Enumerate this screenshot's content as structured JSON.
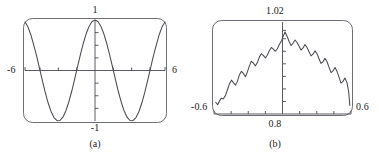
{
  "figure": {
    "caption_a": "(a)",
    "caption_b": "(b)",
    "stroke_color": "#4a4a52",
    "frame_color": "#6e6e76",
    "text_color": "#1b1b1b"
  },
  "chart_data": [
    {
      "type": "line",
      "id": "panel-a",
      "title": "",
      "caption": "(a)",
      "xlabel": "",
      "ylabel": "",
      "xlim": [
        -6,
        6
      ],
      "ylim": [
        -1,
        1
      ],
      "grid": false,
      "legend": null,
      "axis_style": "calculator-screen",
      "tick_labels": {
        "left": "-6",
        "right": "6",
        "top": "1",
        "bottom": "-1"
      },
      "x_ticks": [
        -4.71,
        -3.14,
        -1.57,
        1.57,
        3.14,
        4.71
      ],
      "y_ticks": [
        -0.75,
        -0.5,
        -0.25,
        0.25,
        0.5,
        0.75
      ],
      "series": [
        {
          "name": "cos(x)",
          "x": [
            -6,
            -5.75,
            -5.5,
            -5.25,
            -5,
            -4.75,
            -4.5,
            -4.25,
            -4,
            -3.75,
            -3.5,
            -3.25,
            -3,
            -2.75,
            -2.5,
            -2.25,
            -2,
            -1.75,
            -1.5,
            -1.25,
            -1,
            -0.75,
            -0.5,
            -0.25,
            0,
            0.25,
            0.5,
            0.75,
            1,
            1.25,
            1.5,
            1.75,
            2,
            2.25,
            2.5,
            2.75,
            3,
            3.25,
            3.5,
            3.75,
            4,
            4.25,
            4.5,
            4.75,
            5,
            5.25,
            5.5,
            5.75,
            6
          ],
          "y": [
            0.96,
            0.865,
            0.709,
            0.502,
            0.284,
            0.035,
            -0.211,
            -0.447,
            -0.654,
            -0.821,
            -0.936,
            -0.994,
            -0.99,
            -0.924,
            -0.801,
            -0.628,
            -0.416,
            -0.178,
            0.071,
            0.315,
            0.54,
            0.732,
            0.878,
            0.969,
            1,
            0.969,
            0.878,
            0.732,
            0.54,
            0.315,
            0.071,
            -0.178,
            -0.416,
            -0.628,
            -0.801,
            -0.924,
            -0.99,
            -0.994,
            -0.936,
            -0.821,
            -0.654,
            -0.447,
            -0.211,
            0.035,
            0.284,
            0.502,
            0.709,
            0.865,
            0.96
          ]
        }
      ]
    },
    {
      "type": "line",
      "id": "panel-b",
      "title": "",
      "caption": "(b)",
      "xlabel": "",
      "ylabel": "",
      "xlim": [
        -0.6,
        0.6
      ],
      "ylim": [
        0.8,
        1.02
      ],
      "grid": false,
      "legend": null,
      "axis_style": "calculator-screen",
      "tick_labels": {
        "left": "-0.6",
        "right": "0.6",
        "top": "1.02",
        "bottom": "0.8"
      },
      "x_ticks": [
        -0.45,
        -0.3,
        -0.15,
        0.15,
        0.3,
        0.45
      ],
      "y_ticks": [
        0.83,
        0.86,
        0.89,
        0.92,
        0.95,
        0.98,
        1.0
      ],
      "series": [
        {
          "name": "sampled oscillation",
          "x": [
            -0.585,
            -0.568,
            -0.552,
            -0.536,
            -0.52,
            -0.5,
            -0.482,
            -0.465,
            -0.447,
            -0.43,
            -0.412,
            -0.395,
            -0.378,
            -0.36,
            -0.343,
            -0.325,
            -0.308,
            -0.29,
            -0.273,
            -0.255,
            -0.238,
            -0.22,
            -0.203,
            -0.185,
            -0.168,
            -0.15,
            -0.133,
            -0.115,
            -0.098,
            -0.08,
            -0.063,
            -0.045,
            -0.028,
            -0.012,
            0.005,
            0.022,
            0.04,
            0.057,
            0.075,
            0.092,
            0.11,
            0.127,
            0.145,
            0.162,
            0.18,
            0.197,
            0.215,
            0.232,
            0.25,
            0.267,
            0.285,
            0.302,
            0.32,
            0.337,
            0.355,
            0.372,
            0.39,
            0.407,
            0.425,
            0.442,
            0.46,
            0.477,
            0.495,
            0.512,
            0.53,
            0.547,
            0.565,
            0.58,
            0.59
          ],
          "y": [
            0.828,
            0.822,
            0.831,
            0.838,
            0.836,
            0.844,
            0.858,
            0.872,
            0.881,
            0.875,
            0.869,
            0.878,
            0.893,
            0.902,
            0.897,
            0.889,
            0.9,
            0.915,
            0.926,
            0.922,
            0.915,
            0.923,
            0.936,
            0.944,
            0.94,
            0.934,
            0.941,
            0.952,
            0.959,
            0.955,
            0.95,
            0.956,
            0.966,
            0.973,
            0.985,
            0.996,
            0.986,
            0.974,
            0.964,
            0.969,
            0.977,
            0.971,
            0.962,
            0.953,
            0.958,
            0.966,
            0.959,
            0.949,
            0.939,
            0.943,
            0.951,
            0.944,
            0.932,
            0.921,
            0.925,
            0.933,
            0.925,
            0.912,
            0.899,
            0.903,
            0.911,
            0.902,
            0.888,
            0.874,
            0.878,
            0.886,
            0.875,
            0.852,
            0.82
          ]
        }
      ]
    }
  ],
  "panel_a": {
    "label_top": "1",
    "label_bottom": "-1",
    "label_left": "-6",
    "label_right": "6",
    "caption": "(a)"
  },
  "panel_b": {
    "label_top": "1.02",
    "label_bottom": "0.8",
    "label_left": "-0.6",
    "label_right": "0.6",
    "caption": "(b)"
  }
}
